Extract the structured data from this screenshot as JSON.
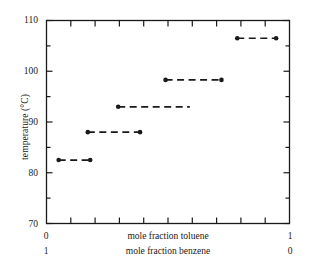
{
  "chart_data": {
    "type": "line",
    "title": "",
    "subtitle": "",
    "xlabel_primary": "mole fraction toluene",
    "xlabel_secondary": "mole fraction benzene",
    "ylabel": "temperature (°C)",
    "xlim_primary": [
      0,
      1
    ],
    "xlim_secondary": [
      1,
      0
    ],
    "ylim": [
      70,
      110
    ],
    "y_major_ticks": [
      70,
      80,
      90,
      100,
      110
    ],
    "y_minor_ticks": [
      75,
      85,
      95,
      105
    ],
    "y_tick_labels": [
      "70",
      "80",
      "90",
      "100",
      "110"
    ],
    "x_major_ticks": [
      0,
      0.1,
      0.2,
      0.3,
      0.4,
      0.5,
      0.6,
      0.7,
      0.8,
      0.9,
      1
    ],
    "x_end_labels_primary": [
      "0",
      "1"
    ],
    "x_end_labels_secondary": [
      "1",
      "0"
    ],
    "grid": false,
    "legend": "none",
    "frame": "box-all-sides",
    "tick_direction": "inward",
    "line_style": "dashed",
    "marker": "filled-circle",
    "series": [
      {
        "name": "stage-1",
        "temperature": 82.5,
        "x_start": 0.05,
        "x_end": 0.18,
        "marker_start": true,
        "marker_end": true
      },
      {
        "name": "stage-2",
        "temperature": 88.0,
        "x_start": 0.17,
        "x_end": 0.385,
        "marker_start": true,
        "marker_end": true
      },
      {
        "name": "stage-3",
        "temperature": 93.0,
        "x_start": 0.295,
        "x_end": 0.59,
        "marker_start": true,
        "marker_end": false
      },
      {
        "name": "stage-4",
        "temperature": 98.3,
        "x_start": 0.49,
        "x_end": 0.72,
        "marker_start": true,
        "marker_end": true
      },
      {
        "name": "stage-5",
        "temperature": 106.5,
        "x_start": 0.785,
        "x_end": 0.945,
        "marker_start": true,
        "marker_end": true
      }
    ]
  },
  "axes": {
    "y_title": "temperature (°C)",
    "y_labels": [
      "110",
      "100",
      "90",
      "80",
      "70"
    ],
    "x_caption_top": "mole fraction toluene",
    "x_caption_bottom": "mole fraction benzene",
    "x_left_top": "0",
    "x_right_top": "1",
    "x_left_bottom": "1",
    "x_right_bottom": "0"
  },
  "colors": {
    "ink": "#1a1a1a",
    "background": "#ffffff"
  }
}
